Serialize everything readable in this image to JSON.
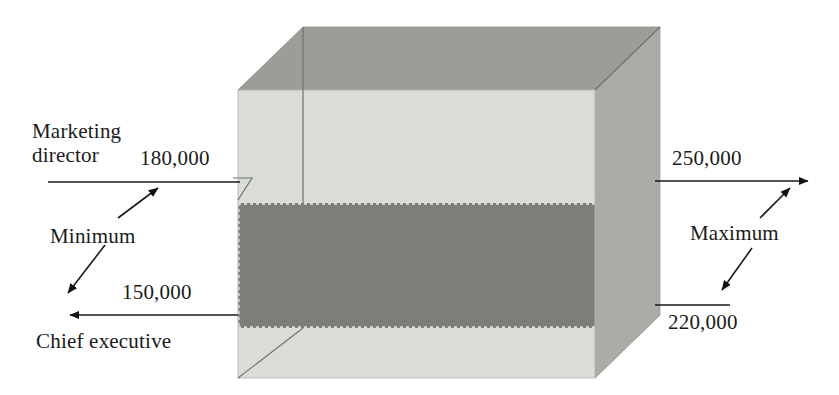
{
  "figure": {
    "type": "3d-box-range-diagram",
    "background_color": "#ffffff",
    "box": {
      "front_face_color": "#d9dcd7",
      "top_face_color": "#9a9d98",
      "right_face_color": "#a9aca7",
      "band_color": "#7b7e79",
      "edge_color": "#6f726d",
      "front_left_x": 238,
      "front_right_x": 595,
      "front_top_y": 90,
      "front_bottom_y": 378,
      "depth_dx": 65,
      "depth_dy": -63,
      "band_top_y": 203,
      "band_bottom_y": 328
    }
  },
  "labels": {
    "marketing_director": "Marketing\ndirector",
    "value_180000": "180,000",
    "minimum": "Minimum",
    "value_150000": "150,000",
    "chief_executive": "Chief executive",
    "value_250000": "250,000",
    "maximum": "Maximum",
    "value_220000": "220,000"
  },
  "chart_data": {
    "type": "bar",
    "title": "",
    "xlabel": "",
    "ylabel": "",
    "categories": [
      "Chief executive",
      "Marketing director"
    ],
    "series": [
      {
        "name": "Minimum",
        "values": [
          150000,
          180000
        ]
      },
      {
        "name": "Maximum",
        "values": [
          220000,
          250000
        ]
      }
    ],
    "annotations": [
      {
        "text": "180,000",
        "role": "minimum-marketing-director",
        "value": 180000,
        "side": "left"
      },
      {
        "text": "150,000",
        "role": "minimum-chief-executive",
        "value": 150000,
        "side": "left"
      },
      {
        "text": "250,000",
        "role": "maximum-marketing-director",
        "value": 250000,
        "side": "right"
      },
      {
        "text": "220,000",
        "role": "maximum-chief-executive",
        "value": 220000,
        "side": "right"
      }
    ],
    "legend": [
      "Minimum",
      "Maximum"
    ],
    "grid": false
  }
}
